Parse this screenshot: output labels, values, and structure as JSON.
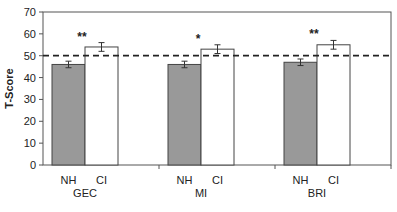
{
  "chart_data": {
    "type": "bar",
    "title": "",
    "xlabel": "",
    "ylabel": "T-Score",
    "ylim": [
      0,
      70
    ],
    "yticks": [
      0,
      10,
      20,
      30,
      40,
      50,
      60,
      70
    ],
    "grid": false,
    "legend": null,
    "reference_line": {
      "y": 50,
      "style": "dashed"
    },
    "categories": [
      "GEC",
      "MI",
      "BRI"
    ],
    "subcategories": [
      "NH",
      "CI"
    ],
    "series": [
      {
        "name": "NH",
        "color": "#999999",
        "values": [
          46,
          46,
          47
        ],
        "error": [
          1.5,
          1.5,
          1.5
        ]
      },
      {
        "name": "CI",
        "color": "#ffffff",
        "values": [
          54,
          53,
          55
        ],
        "error": [
          2,
          2,
          2
        ]
      }
    ],
    "annotations": [
      {
        "category": "GEC",
        "text": "**"
      },
      {
        "category": "MI",
        "text": "*"
      },
      {
        "category": "BRI",
        "text": "**"
      }
    ]
  }
}
